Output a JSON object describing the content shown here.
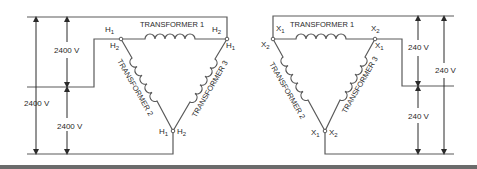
{
  "diagram": {
    "primary": {
      "transformer_1": "TRANSFORMER 1",
      "transformer_2": "TRANSFORMER 2",
      "transformer_3": "TRANSFORMER 3",
      "terminals": {
        "top_left_outer": "H",
        "top_left_outer_sub": "1",
        "top_left_inner": "H",
        "top_left_inner_sub": "2",
        "top_right_outer": "H",
        "top_right_outer_sub": "2",
        "top_right_inner": "H",
        "top_right_inner_sub": "1",
        "bottom_left": "H",
        "bottom_left_sub": "1",
        "bottom_right": "H",
        "bottom_right_sub": "2"
      },
      "voltages": {
        "upper": "2400 V",
        "lower": "2400 V",
        "total": "2400 V"
      }
    },
    "secondary": {
      "transformer_1": "TRANSFORMER 1",
      "transformer_2": "TRANSFORMER 2",
      "transformer_3": "TRANSFORMER 3",
      "terminals": {
        "top_left_outer": "X",
        "top_left_outer_sub": "1",
        "top_left_inner": "X",
        "top_left_inner_sub": "2",
        "top_right_outer": "X",
        "top_right_outer_sub": "2",
        "top_right_inner": "X",
        "top_right_inner_sub": "1",
        "bottom_left": "X",
        "bottom_left_sub": "1",
        "bottom_right": "X",
        "bottom_right_sub": "2"
      },
      "voltages": {
        "upper": "240 V",
        "lower": "240 V",
        "total": "240 V"
      }
    },
    "colors": {
      "line": "#5a5a5a",
      "text": "#2a2a2a",
      "bar": "#6b6b6b"
    }
  }
}
